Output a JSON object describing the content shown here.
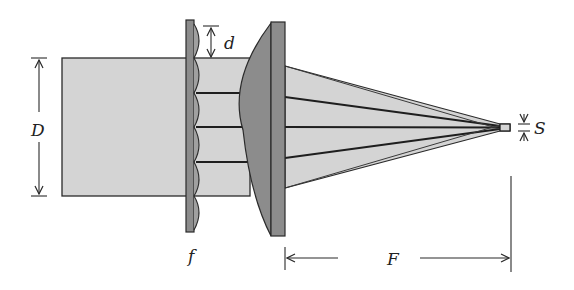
{
  "diagram": {
    "type": "optical-schematic",
    "labels": {
      "beam_diameter": "D",
      "lenslet_pitch": "d",
      "lenslet_focal_length": "f",
      "focal_length": "F",
      "spot_size": "S"
    },
    "colors": {
      "beam_fill": "#d4d4d4",
      "optic_fill": "#8c8c8c",
      "stroke": "#2a2a2a",
      "background": "#ffffff"
    },
    "components": [
      {
        "name": "input-beam",
        "label": "D"
      },
      {
        "name": "microlens-array",
        "label": "f",
        "lenslet_count": 4,
        "pitch_label": "d"
      },
      {
        "name": "focusing-lens",
        "label": "F"
      },
      {
        "name": "focal-spot",
        "label": "S"
      }
    ]
  }
}
